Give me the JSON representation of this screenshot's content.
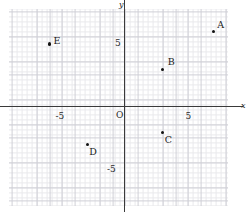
{
  "figure": {
    "kind": "coordinate-plane",
    "origin_label": "O",
    "x_axis_name": "x",
    "y_axis_name": "y"
  },
  "chart_data": {
    "type": "scatter",
    "title": "",
    "xlabel": "x",
    "ylabel": "y",
    "grid": true,
    "legend": "none",
    "xlim": [
      -9.2,
      8.2
    ],
    "ylim": [
      -7.8,
      7.8
    ],
    "xticks": [
      -5,
      5
    ],
    "yticks": [
      -5,
      5
    ],
    "xtick_labels": [
      "-5",
      "5"
    ],
    "ytick_labels": [
      "-5",
      "5"
    ],
    "origin_label": "O",
    "points": [
      {
        "label": "A",
        "x": 7,
        "y": 6,
        "label_dx": 4,
        "label_dy": -12
      },
      {
        "label": "B",
        "x": 3,
        "y": 3,
        "label_dx": 5,
        "label_dy": -13
      },
      {
        "label": "C",
        "x": 3,
        "y": -2,
        "label_dx": 2,
        "label_dy": 2
      },
      {
        "label": "D",
        "x": -3,
        "y": -3,
        "label_dx": 2,
        "label_dy": 1
      },
      {
        "label": "E",
        "x": -6,
        "y": 5,
        "label_dx": 4,
        "label_dy": -9
      }
    ]
  }
}
